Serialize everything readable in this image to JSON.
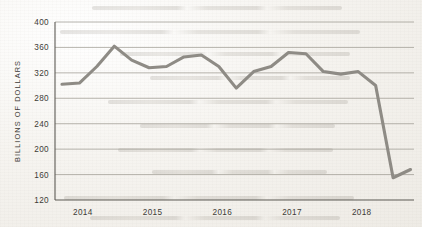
{
  "chart_data": {
    "type": "line",
    "title": "",
    "subtitle": "",
    "xlabel": "",
    "ylabel": "BILLIONS OF DOLLARS",
    "ylim": [
      120,
      400
    ],
    "yticks": [
      120,
      160,
      200,
      240,
      280,
      320,
      360,
      400
    ],
    "ytick_labels": [
      "120",
      "160",
      "200",
      "240",
      "280",
      "320",
      "360",
      "400"
    ],
    "xlim": [
      2013.6,
      2018.75
    ],
    "xticks": [
      2014,
      2015,
      2016,
      2017,
      2018
    ],
    "xtick_labels": [
      "2014",
      "2015",
      "2016",
      "2017",
      "2018"
    ],
    "grid": "horizontal",
    "legend": "none",
    "series": [
      {
        "name": "Value",
        "color": "#8e8b85",
        "x": [
          2013.7,
          2013.95,
          2014.2,
          2014.45,
          2014.7,
          2014.95,
          2015.2,
          2015.45,
          2015.7,
          2015.95,
          2016.2,
          2016.45,
          2016.7,
          2016.95,
          2017.2,
          2017.45,
          2017.7,
          2017.95,
          2018.2,
          2018.45,
          2018.7
        ],
        "values": [
          302,
          304,
          330,
          362,
          340,
          328,
          330,
          345,
          348,
          330,
          296,
          322,
          330,
          352,
          350,
          322,
          318,
          322,
          300,
          155,
          168
        ]
      }
    ]
  },
  "axes": {
    "y_title": "BILLIONS OF DOLLARS"
  },
  "colors": {
    "line": "#8e8b85",
    "grid": "#9a968e",
    "axis": "#5d5a55",
    "text": "#3e3b37",
    "paper": "#f4f2ee"
  }
}
